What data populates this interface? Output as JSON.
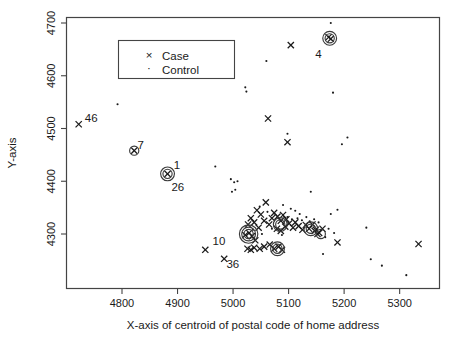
{
  "figure": {
    "background_color": "#ffffff",
    "foreground_color": "#1a1a1a"
  },
  "axes": {
    "x_title": "X-axis of centroid of postal code of home address",
    "y_title": "Y-axis",
    "x_ticks": [
      "4800",
      "4900",
      "5000",
      "5100",
      "5200",
      "5300"
    ],
    "y_ticks": [
      "4300",
      "4400",
      "4500",
      "4600",
      "4700"
    ]
  },
  "legend": {
    "entries": [
      {
        "symbol": "x",
        "label": "Case"
      },
      {
        "symbol": ".",
        "label": "Control"
      }
    ]
  },
  "annotations": [
    {
      "text": "46",
      "x": 4733,
      "y": 4513
    },
    {
      "text": "7",
      "x": 4828,
      "y": 4462
    },
    {
      "text": "1",
      "x": 4893,
      "y": 4424
    },
    {
      "text": "26",
      "x": 4889,
      "y": 4382
    },
    {
      "text": "4",
      "x": 5148,
      "y": 4634
    },
    {
      "text": "10",
      "x": 4963,
      "y": 4280
    },
    {
      "text": "36",
      "x": 4988,
      "y": 4235
    }
  ],
  "chart_data": {
    "type": "scatter",
    "title": "",
    "xlabel": "X-axis of centroid of postal code of home address",
    "ylabel": "Y-axis",
    "xlim": [
      4700,
      5350
    ],
    "ylim": [
      4215,
      4715
    ],
    "grid": false,
    "legend_position": "upper-left-inset",
    "series": [
      {
        "name": "Case",
        "marker": "x",
        "points": [
          [
            4722,
            4508
          ],
          [
            4822,
            4458
          ],
          [
            4882,
            4414
          ],
          [
            5104,
            4658
          ],
          [
            5176,
            4670
          ],
          [
            5172,
            4673
          ],
          [
            5063,
            4519
          ],
          [
            5098,
            4474
          ],
          [
            5059,
            4360
          ],
          [
            5043,
            4345
          ],
          [
            5050,
            4337
          ],
          [
            5032,
            4330
          ],
          [
            5038,
            4322
          ],
          [
            5027,
            4318
          ],
          [
            5046,
            4312
          ],
          [
            5056,
            4325
          ],
          [
            5065,
            4318
          ],
          [
            5070,
            4330
          ],
          [
            5074,
            4340
          ],
          [
            5080,
            4333
          ],
          [
            5086,
            4325
          ],
          [
            5090,
            4336
          ],
          [
            5096,
            4328
          ],
          [
            5079,
            4310
          ],
          [
            5086,
            4306
          ],
          [
            5094,
            4314
          ],
          [
            5101,
            4320
          ],
          [
            5108,
            4312
          ],
          [
            5112,
            4322
          ],
          [
            5118,
            4315
          ],
          [
            5125,
            4308
          ],
          [
            5131,
            4317
          ],
          [
            5137,
            4310
          ],
          [
            5143,
            4318
          ],
          [
            5149,
            4308
          ],
          [
            5155,
            4302
          ],
          [
            5161,
            4310
          ],
          [
            5029,
            4302
          ],
          [
            5034,
            4296
          ],
          [
            5022,
            4298
          ],
          [
            5040,
            4288
          ],
          [
            5026,
            4272
          ],
          [
            5032,
            4270
          ],
          [
            5038,
            4274
          ],
          [
            5048,
            4272
          ],
          [
            5056,
            4276
          ],
          [
            5066,
            4280
          ],
          [
            5074,
            4272
          ],
          [
            5082,
            4276
          ],
          [
            5088,
            4270
          ],
          [
            5147,
            4306
          ],
          [
            5152,
            4300
          ],
          [
            5188,
            4284
          ],
          [
            4950,
            4270
          ],
          [
            4984,
            4253
          ],
          [
            5334,
            4281
          ]
        ]
      },
      {
        "name": "Control",
        "marker": ".",
        "points": [
          [
            5176,
            4700
          ],
          [
            5060,
            4628
          ],
          [
            5180,
            4568
          ],
          [
            5206,
            4483
          ],
          [
            5196,
            4470
          ],
          [
            4792,
            4546
          ],
          [
            5024,
            4570
          ],
          [
            5022,
            4578
          ],
          [
            4968,
            4428
          ],
          [
            5002,
            4398
          ],
          [
            4996,
            4404
          ],
          [
            5008,
            4400
          ],
          [
            4998,
            4380
          ],
          [
            5004,
            4384
          ],
          [
            5140,
            4380
          ],
          [
            5188,
            4346
          ],
          [
            5176,
            4338
          ],
          [
            5090,
            4355
          ],
          [
            5104,
            4348
          ],
          [
            5112,
            4344
          ],
          [
            5120,
            4338
          ],
          [
            5098,
            4332
          ],
          [
            5106,
            4328
          ],
          [
            5116,
            4330
          ],
          [
            5124,
            4326
          ],
          [
            5132,
            4332
          ],
          [
            5138,
            4324
          ],
          [
            5146,
            4328
          ],
          [
            5154,
            4322
          ],
          [
            5062,
            4342
          ],
          [
            5048,
            4352
          ],
          [
            5070,
            4310
          ],
          [
            5036,
            4308
          ],
          [
            5052,
            4300
          ],
          [
            5088,
            4298
          ],
          [
            5172,
            4310
          ],
          [
            5182,
            4302
          ],
          [
            5166,
            4294
          ],
          [
            5162,
            4262
          ],
          [
            5240,
            4312
          ],
          [
            5248,
            4252
          ],
          [
            5268,
            4240
          ],
          [
            5312,
            4222
          ],
          [
            5098,
            4490
          ]
        ]
      }
    ],
    "highlighted_points": [
      {
        "x": 4822,
        "y": 4458,
        "rings": 1
      },
      {
        "x": 4882,
        "y": 4414,
        "rings": 2
      },
      {
        "x": 5174,
        "y": 4671,
        "rings": 2
      },
      {
        "x": 5028,
        "y": 4300,
        "rings": 3
      },
      {
        "x": 5080,
        "y": 4272,
        "rings": 2
      },
      {
        "x": 5085,
        "y": 4318,
        "rings": 2
      },
      {
        "x": 5140,
        "y": 4310,
        "rings": 2
      },
      {
        "x": 5158,
        "y": 4300,
        "rings": 1
      }
    ]
  }
}
